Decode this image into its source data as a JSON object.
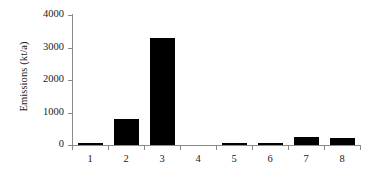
{
  "chart_data": {
    "type": "bar",
    "title": "",
    "subtitle": "",
    "xlabel": "",
    "ylabel": "Emissions (kt/a)",
    "categories": [
      "1",
      "2",
      "3",
      "4",
      "5",
      "6",
      "7",
      "8"
    ],
    "values": [
      50,
      800,
      3300,
      0,
      70,
      50,
      250,
      220
    ],
    "series": [
      {
        "name": "Emissions",
        "values": [
          50,
          800,
          3300,
          0,
          70,
          50,
          250,
          220
        ],
        "color": "#000000"
      }
    ],
    "ylim": [
      0,
      4000
    ],
    "y_ticks": [
      0,
      1000,
      2000,
      3000,
      4000
    ],
    "y_tick_labels": [
      "0",
      "1000",
      "2000",
      "3000",
      "4000"
    ],
    "x_tick_labels": [
      "1",
      "2",
      "3",
      "4",
      "5",
      "6",
      "7",
      "8"
    ],
    "grid": false,
    "legend": false,
    "legend_position": "none",
    "bar_color": "#000000",
    "axis_color": "#8a8a8a",
    "background_color": "#ffffff",
    "annotations": []
  }
}
